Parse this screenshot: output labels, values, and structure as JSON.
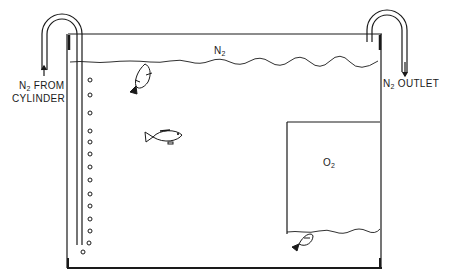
{
  "diagram": {
    "labels": {
      "n2_inlet_line1_prefix": "N",
      "n2_inlet_line1_sub": "2",
      "n2_inlet_line1_suffix": " FROM",
      "n2_inlet_line2": "CYLINDER",
      "n2_outlet_prefix": "N",
      "n2_outlet_sub": "2",
      "n2_outlet_suffix": " OUTLET",
      "headspace_prefix": "N",
      "headspace_sub": "2",
      "o2_prefix": "O",
      "o2_sub": "2"
    },
    "components": [
      "tank",
      "inlet-tube-with-bubbles",
      "outlet-tube",
      "water-surface",
      "o2-chamber",
      "fish-at-surface",
      "fish-midwater",
      "fish-under-o2-chamber"
    ],
    "bubble_count": 15,
    "colors": {
      "line": "#1a1a1a",
      "background": "#ffffff"
    }
  }
}
